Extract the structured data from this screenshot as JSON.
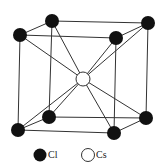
{
  "diagram": {
    "colors": {
      "cl_fill": "#111111",
      "cs_fill": "#ffffff",
      "line": "#333333"
    },
    "atoms": {
      "corners": [
        {
          "id": "back-top-left",
          "x": 52,
          "y": 21,
          "species": "Cl"
        },
        {
          "id": "front-top-left",
          "x": 20,
          "y": 35,
          "species": "Cl"
        },
        {
          "id": "back-top-right",
          "x": 148,
          "y": 23,
          "species": "Cl"
        },
        {
          "id": "front-top-right",
          "x": 116,
          "y": 38,
          "species": "Cl"
        },
        {
          "id": "back-bottom-left",
          "x": 49,
          "y": 117,
          "species": "Cl"
        },
        {
          "id": "front-bottom-left",
          "x": 18,
          "y": 130,
          "species": "Cl"
        },
        {
          "id": "back-bottom-right",
          "x": 146,
          "y": 118,
          "species": "Cl"
        },
        {
          "id": "front-bottom-right",
          "x": 114,
          "y": 133,
          "species": "Cl"
        }
      ],
      "center": {
        "id": "center",
        "x": 83,
        "y": 79,
        "species": "Cs"
      }
    },
    "legend": [
      {
        "symbol": "filled-circle",
        "label": "Cl"
      },
      {
        "symbol": "open-circle",
        "label": "Cs"
      }
    ]
  }
}
